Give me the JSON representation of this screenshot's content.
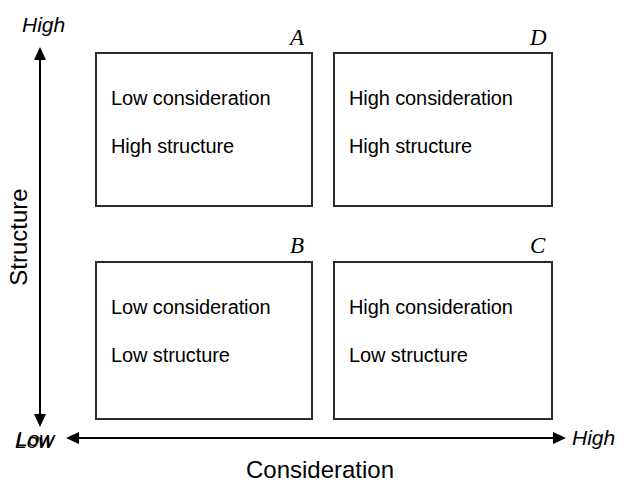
{
  "diagram": {
    "type": "2x2-matrix",
    "axes": {
      "x": {
        "title": "Consideration",
        "low_label": "Low",
        "high_label": "High",
        "direction": "double-headed"
      },
      "y": {
        "title": "Structure",
        "low_label": "Low",
        "high_label": "High",
        "direction": "double-headed"
      }
    },
    "quadrants": [
      {
        "letter": "A",
        "position": "top-left",
        "line1": "Low consideration",
        "line2": "High structure"
      },
      {
        "letter": "D",
        "position": "top-right",
        "line1": "High consideration",
        "line2": "High structure"
      },
      {
        "letter": "B",
        "position": "bottom-left",
        "line1": "Low consideration",
        "line2": "Low structure"
      },
      {
        "letter": "C",
        "position": "bottom-right",
        "line1": "High consideration",
        "line2": "Low structure"
      }
    ],
    "colors": {
      "background": "#ffffff",
      "box_border": "#2b2b2b",
      "axis": "#000000",
      "text": "#000000"
    }
  }
}
